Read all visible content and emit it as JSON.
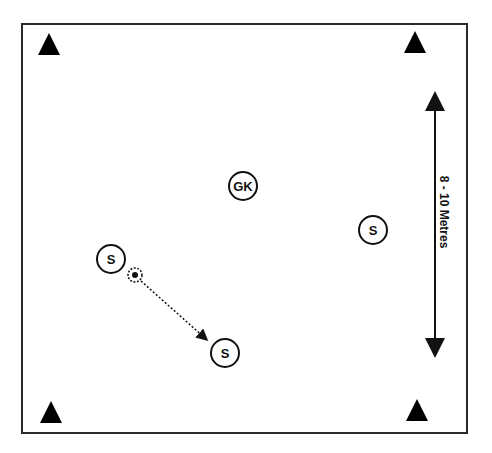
{
  "diagram": {
    "title": "",
    "pitch": {
      "x": 22,
      "y": 24,
      "width": 445,
      "height": 409,
      "stroke": "#2a2a2a"
    },
    "cones": [
      {
        "id": "cone-top-left",
        "cx": 49,
        "top": 33
      },
      {
        "id": "cone-top-right",
        "cx": 415,
        "top": 31
      },
      {
        "id": "cone-bottom-left",
        "cx": 51,
        "top": 401
      },
      {
        "id": "cone-bottom-right",
        "cx": 417,
        "top": 399
      }
    ],
    "players": [
      {
        "id": "goalkeeper",
        "label": "GK",
        "cx": 243,
        "cy": 186
      },
      {
        "id": "striker-right",
        "label": "S",
        "cx": 373,
        "cy": 230
      },
      {
        "id": "striker-left",
        "label": "S",
        "cx": 111,
        "cy": 259
      },
      {
        "id": "striker-bottom",
        "label": "S",
        "cx": 225,
        "cy": 353
      }
    ],
    "ball": {
      "cx": 135,
      "cy": 275,
      "r": 7
    },
    "pass": {
      "from": [
        141,
        281
      ],
      "to": [
        208,
        341
      ],
      "style": "dotted"
    },
    "distance": {
      "label": "8 - 10 Metres",
      "x": 435,
      "y_top": 90,
      "y_bottom": 359
    }
  }
}
